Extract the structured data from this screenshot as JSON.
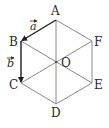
{
  "diagram": {
    "colors": {
      "line": "#8a8a8a",
      "vector": "#1e1e1e",
      "text": "#2a2a2a",
      "background": "#ffffff"
    },
    "vertices": [
      {
        "name": "A",
        "x": 56,
        "y": 20
      },
      {
        "name": "B",
        "x": 21,
        "y": 41
      },
      {
        "name": "C",
        "x": 21,
        "y": 83
      },
      {
        "name": "D",
        "x": 56,
        "y": 104
      },
      {
        "name": "E",
        "x": 92,
        "y": 83
      },
      {
        "name": "F",
        "x": 92,
        "y": 41
      },
      {
        "name": "O",
        "x": 56,
        "y": 62
      }
    ],
    "labels": {
      "A": "A",
      "B": "B",
      "C": "C",
      "D": "D",
      "E": "E",
      "F": "F",
      "O": "O"
    },
    "vectors": [
      {
        "name": "a",
        "label": "a",
        "from": "A",
        "to": "B"
      },
      {
        "name": "b",
        "label": "b",
        "from": "B",
        "to": "C"
      }
    ],
    "diagonals": [
      "AD",
      "BE",
      "CF"
    ]
  }
}
